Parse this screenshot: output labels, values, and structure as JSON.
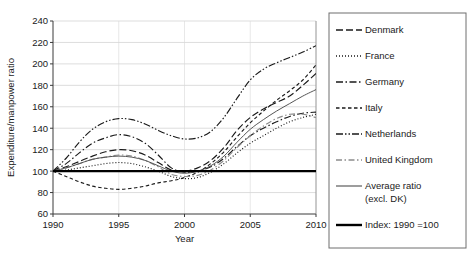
{
  "chart_data": {
    "type": "line",
    "title": "",
    "xlabel": "Year",
    "ylabel": "Expenditure/manpower ratio",
    "xlim": [
      1990,
      2010
    ],
    "ylim": [
      60,
      240
    ],
    "xticks": [
      1990,
      1995,
      2000,
      2005,
      2010
    ],
    "yticks": [
      60,
      80,
      100,
      120,
      140,
      160,
      180,
      200,
      220,
      240
    ],
    "grid": true,
    "legend_position": "right-outside",
    "x": [
      1990,
      1991,
      1992,
      1993,
      1994,
      1995,
      1996,
      1997,
      1998,
      1999,
      2000,
      2001,
      2002,
      2003,
      2004,
      2005,
      2006,
      2007,
      2008,
      2009,
      2010
    ],
    "series": [
      {
        "name": "Denmark",
        "style": "long-dash",
        "color": "#1a1a1a",
        "values": [
          100,
          104,
          109,
          114,
          118,
          120,
          119,
          115,
          108,
          101,
          100,
          103,
          110,
          122,
          138,
          150,
          158,
          164,
          170,
          180,
          191
        ]
      },
      {
        "name": "France",
        "style": "dotted",
        "color": "#1a1a1a",
        "values": [
          100,
          101,
          103,
          105,
          107,
          108,
          107,
          104,
          100,
          95,
          93,
          94,
          99,
          107,
          117,
          126,
          133,
          140,
          146,
          150,
          153
        ]
      },
      {
        "name": "Germany",
        "style": "dash-dot",
        "color": "#1a1a1a",
        "values": [
          100,
          107,
          117,
          126,
          131,
          134,
          132,
          126,
          115,
          103,
          99,
          100,
          104,
          112,
          123,
          133,
          140,
          146,
          151,
          154,
          155
        ]
      },
      {
        "name": "Italy",
        "style": "short-dash",
        "color": "#1a1a1a",
        "values": [
          100,
          95,
          90,
          86,
          84,
          83,
          84,
          86,
          89,
          91,
          94,
          99,
          107,
          118,
          132,
          145,
          156,
          166,
          175,
          185,
          199
        ]
      },
      {
        "name": "Netherlands",
        "style": "dash-dot-dot",
        "color": "#1a1a1a",
        "values": [
          100,
          112,
          127,
          139,
          146,
          149,
          148,
          144,
          138,
          133,
          130,
          131,
          137,
          150,
          168,
          185,
          195,
          201,
          206,
          211,
          217
        ]
      },
      {
        "name": "United Kingdom",
        "style": "dash-dot-grey",
        "color": "#8c8c8c",
        "values": [
          100,
          103,
          107,
          111,
          113,
          115,
          114,
          110,
          104,
          97,
          95,
          96,
          101,
          110,
          122,
          133,
          142,
          149,
          153,
          153,
          150
        ]
      },
      {
        "name": "Average ratio (excl. DK)",
        "style": "solid-thin",
        "color": "#4d4d4d",
        "values": [
          100,
          103,
          107,
          111,
          113,
          114,
          113,
          110,
          105,
          100,
          98,
          100,
          105,
          114,
          127,
          139,
          148,
          156,
          163,
          170,
          176
        ]
      },
      {
        "name": "Index: 1990 =100",
        "style": "solid-thick",
        "color": "#000000",
        "values": [
          100,
          100,
          100,
          100,
          100,
          100,
          100,
          100,
          100,
          100,
          100,
          100,
          100,
          100,
          100,
          100,
          100,
          100,
          100,
          100,
          100
        ]
      }
    ]
  },
  "legend": {
    "items": [
      {
        "label": "Denmark"
      },
      {
        "label": "France"
      },
      {
        "label": "Germany"
      },
      {
        "label": "Italy"
      },
      {
        "label": "Netherlands"
      },
      {
        "label": "United Kingdom"
      },
      {
        "label": "Average ratio"
      },
      {
        "label": "(excl. DK)"
      },
      {
        "label": "Index: 1990 =100"
      }
    ]
  }
}
